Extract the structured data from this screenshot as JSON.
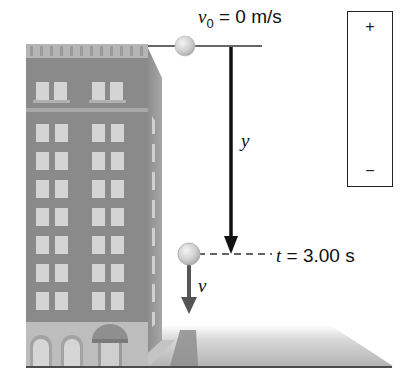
{
  "figure": {
    "type": "free-fall physics diagram",
    "initial_velocity_label": {
      "symbol": "v",
      "subscript": "0",
      "rest": " = 0 m/s"
    },
    "displacement_label": "y",
    "time_label": {
      "symbol": "t",
      "rest": " = 3.00 s"
    },
    "velocity_label": "v",
    "sign_convention": {
      "positive": "+",
      "negative": "−",
      "up_is": "positive",
      "down_is": "negative"
    }
  },
  "colors": {
    "building": "#8a8a8a",
    "building_side": "#9d9d9d",
    "window": "#d6d6d6",
    "ball": "#c8c8c8",
    "arrow_black": "#111111",
    "arrow_velocity": "#555555",
    "ground": "#b8b8b8"
  }
}
